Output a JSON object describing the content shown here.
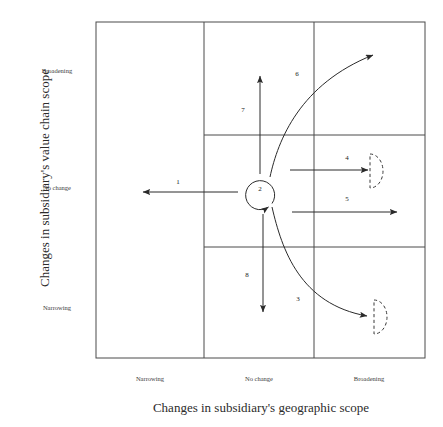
{
  "axes": {
    "y_title": "Changes in subsidiary's value chain scope",
    "x_title": "Changes in subsidiary's geographic scope",
    "y_ticks": [
      {
        "label": "Broadening",
        "top": 67
      },
      {
        "label": "No change",
        "top": 184
      },
      {
        "label": "Narrowing",
        "top": 304
      }
    ],
    "x_ticks": [
      {
        "label": "Narrowing",
        "left": 110
      },
      {
        "label": "No change",
        "left": 219
      },
      {
        "label": "Broadening",
        "left": 329
      }
    ]
  },
  "grid": {
    "left": 96,
    "top": 22,
    "right": 425,
    "bottom": 358,
    "v_dividers": [
      204,
      314
    ],
    "h_dividers": [
      135,
      247
    ],
    "stroke": "#4a4a4a"
  },
  "arrows": [
    {
      "id": "1",
      "name": "arrow-1-narrow-geographic",
      "label": "1",
      "label_x": 178,
      "label_y": 182,
      "kind": "straight"
    },
    {
      "id": "2",
      "name": "arrow-2-no-change-loop",
      "label": "2",
      "label_x": 260,
      "label_y": 189,
      "kind": "circular"
    },
    {
      "id": "3",
      "name": "arrow-3-broaden-geo-narrow-value",
      "label": "3",
      "label_x": 298,
      "label_y": 299,
      "kind": "curved"
    },
    {
      "id": "4",
      "name": "arrow-4-broaden-geographic-partial",
      "label": "4",
      "label_x": 347,
      "label_y": 158,
      "kind": "straight"
    },
    {
      "id": "5",
      "name": "arrow-5-broaden-geographic-full",
      "label": "5",
      "label_x": 347,
      "label_y": 199,
      "kind": "straight"
    },
    {
      "id": "6",
      "name": "arrow-6-broaden-geo-broaden-value",
      "label": "6",
      "label_x": 297,
      "label_y": 74,
      "kind": "curved"
    },
    {
      "id": "7",
      "name": "arrow-7-broaden-value-chain",
      "label": "7",
      "label_x": 243,
      "label_y": 110,
      "kind": "straight"
    },
    {
      "id": "8",
      "name": "arrow-8-narrow-value-chain",
      "label": "8",
      "label_x": 247,
      "label_y": 275,
      "kind": "straight"
    }
  ],
  "colors": {
    "line": "#4a4a4a",
    "arrow": "#2a2a2a",
    "text": "#2b2b2b",
    "dashed": "#3a3a3a"
  }
}
